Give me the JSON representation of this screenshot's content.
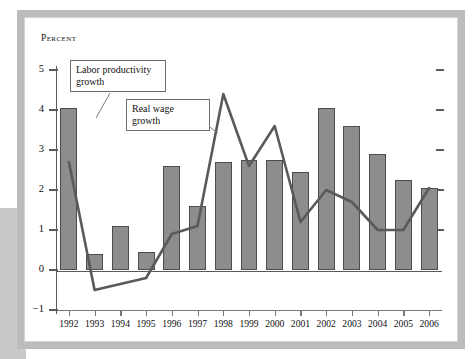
{
  "figure": {
    "y_axis_title": "Percent",
    "callouts": {
      "productivity": "Labor productivity growth",
      "wage": "Real wage growth"
    }
  },
  "chart_data": {
    "type": "bar",
    "title": "",
    "xlabel": "",
    "ylabel": "Percent",
    "ylim": [
      -1,
      5
    ],
    "yticks": [
      -1,
      0,
      1,
      2,
      3,
      4,
      5
    ],
    "ytick_labels": [
      "−1",
      "0",
      "1",
      "2",
      "3",
      "4",
      "5"
    ],
    "grid": false,
    "legend_position": "callout-annotations",
    "categories": [
      "1992",
      "1993",
      "1994",
      "1995",
      "1996",
      "1997",
      "1998",
      "1999",
      "2000",
      "2001",
      "2002",
      "2003",
      "2004",
      "2005",
      "2006"
    ],
    "series": [
      {
        "name": "Labor productivity growth",
        "type": "bar",
        "color": "#8d8d8d",
        "values": [
          4.05,
          0.4,
          1.1,
          0.45,
          2.6,
          1.6,
          2.7,
          2.75,
          2.75,
          2.45,
          4.05,
          3.6,
          2.9,
          2.25,
          2.05
        ]
      },
      {
        "name": "Real wage growth",
        "type": "line",
        "color": "#5a5a5a",
        "values": [
          2.7,
          -0.5,
          -0.35,
          -0.2,
          0.9,
          1.1,
          4.4,
          2.6,
          3.6,
          1.2,
          2.0,
          1.7,
          1.0,
          1.0,
          2.05
        ]
      }
    ]
  }
}
